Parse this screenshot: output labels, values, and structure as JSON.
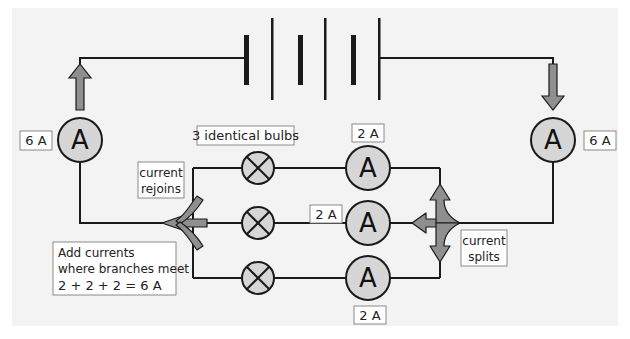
{
  "diagram": {
    "colors": {
      "background_outer": "#ffffff",
      "panel": "#f3f3f3",
      "wire": "#1a1a1a",
      "meter_fill": "#d6d6d6",
      "arrow_fill": "#8f8f8f",
      "label_border": "#8a8a8a",
      "label_fill": "#ffffff"
    },
    "battery": {
      "cells": 3
    },
    "ammeters": {
      "symbol": "A",
      "main_left": {
        "reading": "6 A"
      },
      "main_right": {
        "reading": "6 A"
      },
      "branch_top": {
        "reading": "2 A"
      },
      "branch_middle": {
        "reading": "2 A"
      },
      "branch_bottom": {
        "reading": "2 A"
      }
    },
    "labels": {
      "bulbs": "3 identical bulbs",
      "rejoins_line1": "current",
      "rejoins_line2": "rejoins",
      "splits_line1": "current",
      "splits_line2": "splits",
      "add_line1": "Add currents",
      "add_line2": "where branches meet",
      "add_line3": "2 + 2 + 2 = 6 A"
    }
  }
}
